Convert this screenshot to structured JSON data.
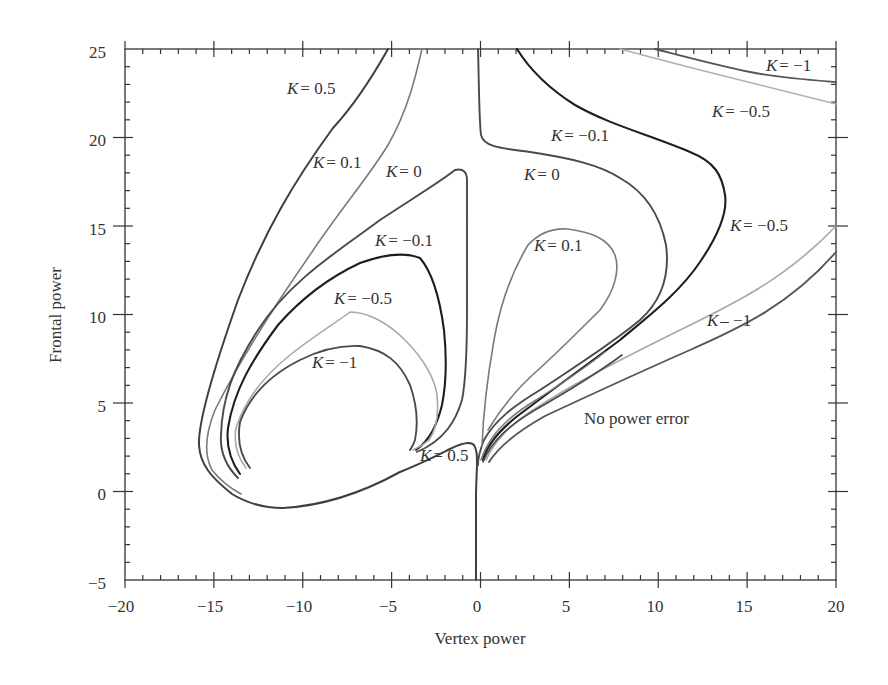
{
  "chart_data": {
    "type": "line",
    "title": "",
    "xlabel": "Vertex power",
    "ylabel": "Frontal power",
    "xlim": [
      -20,
      20
    ],
    "ylim": [
      -5,
      25
    ],
    "xticks": [
      -20,
      -15,
      -10,
      -5,
      0,
      5,
      10,
      15,
      20
    ],
    "yticks": [
      -5,
      0,
      5,
      10,
      15,
      20,
      25
    ],
    "xtick_labels": [
      "−20",
      "−15",
      "−10",
      "−5",
      "0",
      "5",
      "10",
      "15",
      "20"
    ],
    "ytick_labels": [
      "−5",
      "0",
      "5",
      "10",
      "15",
      "20",
      "25"
    ],
    "grid": false,
    "legend": "none (inline curve labels)",
    "annotations": [
      {
        "text": "No power error",
        "x": 7,
        "y": 4.3
      }
    ],
    "series": [
      {
        "name": "K = 0.5",
        "branch": "left",
        "points": [
          [
            -5.0,
            25
          ],
          [
            -7.4,
            21
          ],
          [
            -9.9,
            18
          ],
          [
            -12,
            14.8
          ],
          [
            -14,
            10
          ],
          [
            -15.5,
            5
          ],
          [
            -15.6,
            3
          ],
          [
            -14.5,
            1.2
          ],
          [
            -13,
            -0.3
          ],
          [
            -11,
            -0.9
          ],
          [
            -8,
            -0.6
          ],
          [
            -5,
            0.6
          ],
          [
            -2,
            2
          ],
          [
            -1,
            3.2
          ],
          [
            -0.2,
            3.5
          ],
          [
            0,
            3
          ]
        ]
      },
      {
        "name": "K = 0.5",
        "branch": "stem",
        "points": [
          [
            0,
            3
          ],
          [
            -0.1,
            0
          ],
          [
            -0.1,
            -5
          ]
        ]
      },
      {
        "name": "K = 0.1",
        "branch": "left",
        "points": [
          [
            -3.2,
            25
          ],
          [
            -4.2,
            21
          ],
          [
            -6,
            17.3
          ],
          [
            -9.5,
            13.5
          ],
          [
            -12.5,
            9
          ],
          [
            -14.5,
            5
          ],
          [
            -15,
            3
          ],
          [
            -14,
            1.2
          ],
          [
            -12.5,
            0
          ]
        ]
      },
      {
        "name": "K = 0",
        "branch": "left loop",
        "points": [
          [
            -13.5,
            0.8
          ],
          [
            -14.3,
            3
          ],
          [
            -13.8,
            6.5
          ],
          [
            -11.5,
            11
          ],
          [
            -8,
            14.3
          ],
          [
            -4,
            17
          ],
          [
            -1.4,
            18.3
          ],
          [
            -0.9,
            17.8
          ],
          [
            -0.9,
            12
          ],
          [
            -1.0,
            7
          ],
          [
            -1.5,
            4.5
          ],
          [
            -3.5,
            2.3
          ]
        ]
      },
      {
        "name": "K = 0",
        "branch": "right",
        "points": [
          [
            0.05,
            25
          ],
          [
            0.2,
            22
          ],
          [
            0.6,
            19.4
          ],
          [
            3,
            18.8
          ],
          [
            6,
            17.6
          ],
          [
            8.5,
            15.5
          ],
          [
            9.8,
            12
          ],
          [
            9.4,
            9.5
          ],
          [
            7,
            7
          ],
          [
            3.5,
            4.7
          ],
          [
            1.5,
            3.8
          ],
          [
            0.4,
            2.5
          ]
        ]
      },
      {
        "name": "K = 0.1",
        "branch": "right loop",
        "points": [
          [
            0.3,
            2.8
          ],
          [
            0.4,
            5
          ],
          [
            1.2,
            9
          ],
          [
            2.3,
            12.8
          ],
          [
            3.8,
            14.6
          ],
          [
            5.5,
            14.8
          ],
          [
            7.5,
            14
          ],
          [
            7.8,
            12.5
          ],
          [
            7,
            10
          ],
          [
            5,
            7.5
          ],
          [
            2.8,
            5.5
          ],
          [
            1,
            4
          ]
        ]
      },
      {
        "name": "K = -0.1",
        "branch": "left loop",
        "points": [
          [
            -13.3,
            1
          ],
          [
            -14,
            3
          ],
          [
            -13.5,
            6
          ],
          [
            -11.2,
            9.8
          ],
          [
            -8.5,
            12.5
          ],
          [
            -5.5,
            13.5
          ],
          [
            -3.3,
            13.2
          ],
          [
            -2,
            10.5
          ],
          [
            -1.7,
            7
          ],
          [
            -2.2,
            4.5
          ],
          [
            -3.5,
            2.4
          ]
        ]
      },
      {
        "name": "K = -0.1",
        "branch": "right",
        "points": [
          [
            2.2,
            25
          ],
          [
            3.5,
            23.2
          ],
          [
            6,
            21.3
          ],
          [
            9,
            20.3
          ],
          [
            12,
            18.8
          ],
          [
            13.8,
            16.5
          ],
          [
            13,
            14
          ],
          [
            10,
            10.5
          ],
          [
            6.5,
            7.7
          ],
          [
            3.5,
            5.6
          ],
          [
            1.5,
            4
          ],
          [
            0.5,
            2.6
          ]
        ]
      },
      {
        "name": "K = -0.5",
        "branch": "left loop",
        "points": [
          [
            -13,
            1.3
          ],
          [
            -13.5,
            3.3
          ],
          [
            -12.5,
            6
          ],
          [
            -10.5,
            8.5
          ],
          [
            -7.3,
            10.2
          ],
          [
            -5.5,
            9.8
          ],
          [
            -3.3,
            8
          ],
          [
            -2.2,
            5.5
          ],
          [
            -2.7,
            3.5
          ],
          [
            -3.6,
            2.5
          ]
        ]
      },
      {
        "name": "K = -0.5",
        "branch": "right",
        "points": [
          [
            0.6,
            2.7
          ],
          [
            2,
            4.7
          ],
          [
            5,
            6.8
          ],
          [
            9,
            9
          ],
          [
            13,
            11
          ],
          [
            17,
            13
          ],
          [
            20,
            14.9
          ]
        ]
      },
      {
        "name": "K = -0.5",
        "branch": "top right",
        "points": [
          [
            8,
            25
          ],
          [
            11,
            24.5
          ],
          [
            14,
            23.7
          ],
          [
            17,
            22.8
          ],
          [
            20,
            22
          ]
        ]
      },
      {
        "name": "K = -1",
        "branch": "left loop",
        "points": [
          [
            -12.8,
            1.4
          ],
          [
            -13,
            3.5
          ],
          [
            -12,
            6
          ],
          [
            -9.8,
            7.8
          ],
          [
            -7.5,
            8.3
          ],
          [
            -5.5,
            7.5
          ],
          [
            -4,
            5.5
          ],
          [
            -3.8,
            3.3
          ],
          [
            -3.8,
            2.4
          ]
        ]
      },
      {
        "name": "K = -1",
        "branch": "right",
        "points": [
          [
            0.8,
            2.6
          ],
          [
            2.5,
            4.3
          ],
          [
            5.5,
            6
          ],
          [
            9.5,
            8
          ],
          [
            13.5,
            10
          ],
          [
            17,
            12
          ],
          [
            20,
            13.5
          ]
        ]
      },
      {
        "name": "K = -1",
        "branch": "top right",
        "points": [
          [
            10,
            25
          ],
          [
            13,
            24.3
          ],
          [
            15,
            23.8
          ],
          [
            17,
            23.4
          ],
          [
            20,
            23.1
          ]
        ]
      }
    ],
    "curve_labels": [
      {
        "text": "K = 0.5",
        "x": -11,
        "y": 22.7
      },
      {
        "text": "K = 0.1",
        "x": -9,
        "y": 18.2
      },
      {
        "text": "K = 0",
        "x": -5,
        "y": 17.6
      },
      {
        "text": "K = −0.1",
        "x": -3.5,
        "y": 14.1
      },
      {
        "text": "K = −0.5",
        "x": -8,
        "y": 10.8
      },
      {
        "text": "K = −1",
        "x": -9,
        "y": 7.1
      },
      {
        "text": "K = 0.5",
        "x": -1.5,
        "y": 2
      },
      {
        "text": "K = −0.1",
        "x": 5.5,
        "y": 20.1
      },
      {
        "text": "K = 0",
        "x": 3.3,
        "y": 17.6
      },
      {
        "text": "K = 0.1",
        "x": 4.8,
        "y": 13.9
      },
      {
        "text": "K = −0.5",
        "x": 16.7,
        "y": 14.9
      },
      {
        "text": "K – −1",
        "x": 16.6,
        "y": 9.5
      },
      {
        "text": "K = −1",
        "x": 18.5,
        "y": 24.1
      },
      {
        "text": "K = −0.5",
        "x": 15.7,
        "y": 21.9
      }
    ]
  },
  "labels": {
    "xlabel": "Vertex power",
    "ylabel": "Frontal power",
    "region": "No power error",
    "x_ticks": [
      "−20",
      "−15",
      "−10",
      "−5",
      "0",
      "5",
      "10",
      "15",
      "20"
    ],
    "y_ticks": [
      "25",
      "20",
      "15",
      "10",
      "5",
      "0",
      "−5"
    ],
    "curves": {
      "k05_top": "= 0.5",
      "k01_top": "= 0.1",
      "k0_left": "= 0",
      "km01_left": "= −0.1",
      "km05_left": "= −0.5",
      "km1_left": "= −1",
      "k05_bottom": "= 0.5",
      "km01_right": "= −0.1",
      "k0_right": "= 0",
      "k01_right": "= 0.1",
      "km05_right": "= −0.5",
      "km1_right": "– −1",
      "km1_top": "= −1",
      "km05_top": "= −0.5",
      "k": "K"
    }
  },
  "colors": {
    "axis": "#333333",
    "k_dark": "#3a3a3a",
    "k_mid": "#555555",
    "k_gray": "#7a7a7a",
    "k_light": "#a8a8a8",
    "k_black": "#1e1e1e"
  }
}
